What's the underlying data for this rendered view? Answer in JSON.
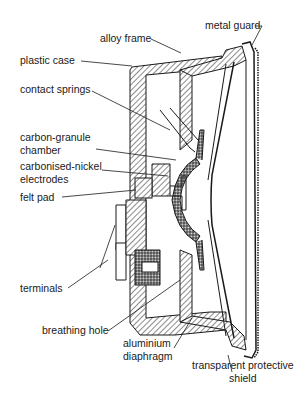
{
  "diagram": {
    "labels": {
      "alloy_frame": "alloy frame",
      "metal_guard": "metal guard",
      "plastic_case": "plastic case",
      "contact_springs": "contact springs",
      "carbon_granule_chamber": "carbon-granule\nchamber",
      "carbonised_nickel_electrodes": "carbonised-nickel\nelectrodes",
      "felt_pad": "felt pad",
      "terminals": "terminals",
      "breathing_hole": "breathing hole",
      "aluminium_diaphragm": "aluminium\ndiaphragm",
      "transparent_protective_shield": "transparent protective\nshield"
    },
    "colors": {
      "line": "#1a1a1a",
      "background": "#ffffff",
      "granule": "#555555"
    }
  }
}
